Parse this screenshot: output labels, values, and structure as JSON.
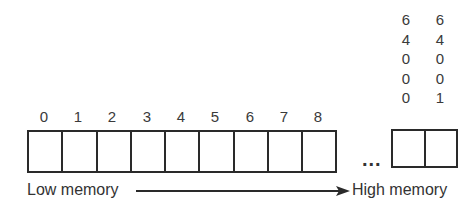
{
  "diagram": {
    "low_cells": {
      "indices": [
        "0",
        "1",
        "2",
        "3",
        "4",
        "5",
        "6",
        "7",
        "8"
      ]
    },
    "ellipsis": "...",
    "high_cells": {
      "columns": [
        {
          "digits": [
            "6",
            "4",
            "0",
            "0",
            "0"
          ]
        },
        {
          "digits": [
            "6",
            "4",
            "0",
            "0",
            "1"
          ]
        }
      ]
    },
    "arrow": {
      "start_label": "Low memory",
      "end_label": "High memory"
    }
  }
}
